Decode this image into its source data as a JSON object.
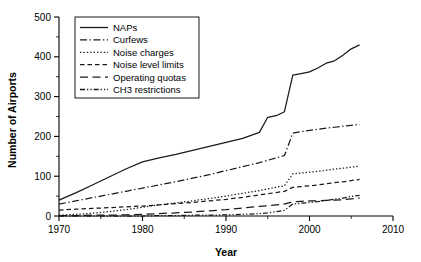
{
  "chart_data": {
    "type": "line",
    "title": "",
    "xlabel": "Year",
    "ylabel": "Number of Airports",
    "xlim": [
      1970,
      2010
    ],
    "ylim": [
      0,
      500
    ],
    "xticks": [
      1970,
      1980,
      1990,
      2000,
      2010
    ],
    "xtick_labels": [
      "1970",
      "1980",
      "1990",
      "2000",
      "2010"
    ],
    "yticks": [
      0,
      100,
      200,
      300,
      400,
      500
    ],
    "ytick_labels": [
      "0",
      "100",
      "200",
      "300",
      "400",
      "500"
    ],
    "xminor_ticks": [
      1975,
      1985,
      1995,
      2005
    ],
    "yminor_ticks": [
      50,
      150,
      250,
      350,
      450
    ],
    "grid": false,
    "legend_position": "top-left",
    "x": [
      1970,
      1972,
      1974,
      1976,
      1978,
      1980,
      1982,
      1984,
      1986,
      1988,
      1990,
      1992,
      1994,
      1995,
      1996,
      1997,
      1998,
      1999,
      2000,
      2001,
      2002,
      2003,
      2004,
      2005,
      2006
    ],
    "series": [
      {
        "name": "NAPs",
        "style": "solid",
        "values": [
          40,
          58,
          78,
          98,
          118,
          136,
          146,
          155,
          165,
          175,
          185,
          195,
          210,
          248,
          252,
          262,
          354,
          358,
          362,
          372,
          384,
          390,
          404,
          420,
          430
        ]
      },
      {
        "name": "Curfews",
        "style": "dash-dot",
        "values": [
          30,
          38,
          46,
          54,
          62,
          70,
          78,
          86,
          95,
          104,
          114,
          124,
          134,
          140,
          146,
          152,
          208,
          212,
          215,
          218,
          221,
          223,
          226,
          228,
          230
        ]
      },
      {
        "name": "Noise charges",
        "style": "dotted",
        "values": [
          2,
          4,
          7,
          11,
          16,
          22,
          28,
          33,
          38,
          44,
          50,
          57,
          64,
          68,
          72,
          76,
          106,
          108,
          110,
          112,
          115,
          118,
          120,
          123,
          125
        ]
      },
      {
        "name": "Noise level limits",
        "style": "dashed",
        "values": [
          15,
          17,
          19,
          21,
          23,
          25,
          28,
          31,
          34,
          38,
          42,
          47,
          53,
          56,
          59,
          62,
          72,
          74,
          76,
          78,
          81,
          84,
          86,
          89,
          92
        ]
      },
      {
        "name": "Operating quotas",
        "style": "long-dash",
        "values": [
          1,
          1,
          2,
          2,
          3,
          4,
          6,
          8,
          10,
          13,
          16,
          20,
          24,
          26,
          28,
          30,
          36,
          37,
          38,
          38,
          39,
          40,
          41,
          43,
          45
        ]
      },
      {
        "name": "CH3 restrictions",
        "style": "dash-dot-dot",
        "values": [
          0,
          0,
          0,
          0,
          0,
          0,
          1,
          1,
          2,
          2,
          3,
          4,
          6,
          8,
          11,
          14,
          30,
          32,
          34,
          36,
          39,
          42,
          45,
          49,
          52
        ]
      }
    ],
    "colors": {
      "line": "#1a1a1a",
      "axis": "#000000",
      "background": "#ffffff"
    }
  }
}
